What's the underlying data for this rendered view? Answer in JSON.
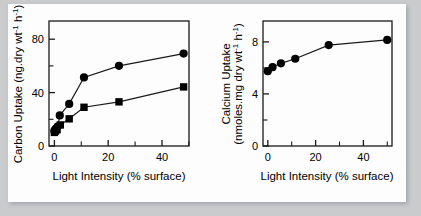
{
  "figure": {
    "background_color": "#c9cbcd",
    "panel_color": "#fdfdfd",
    "line_color": "#1a1a1a",
    "marker_color": "#000000"
  },
  "chart_data": [
    {
      "type": "line",
      "id": "carbon-uptake",
      "title": "",
      "xlabel": "Light Intensity (% surface)",
      "ylabel": "Carbon Uptake (ng.dry wt⁻¹ h⁻¹)",
      "ylabel_main": "Carbon Uptake",
      "ylabel_units": "(ng.dry wt⁻¹ h⁻¹)",
      "xlim": [
        -2,
        50
      ],
      "ylim": [
        0,
        92
      ],
      "xticks": [
        0,
        20,
        40
      ],
      "xticks_minor": [
        10,
        30,
        50
      ],
      "yticks": [
        0,
        40,
        80
      ],
      "yticks_minor": [
        20,
        60
      ],
      "grid": false,
      "legend": "none",
      "series": [
        {
          "name": "circles",
          "marker": "circle",
          "x": [
            0.0,
            0.3,
            0.7,
            1.3,
            2.0,
            5.5,
            11.0,
            24.0,
            48.0
          ],
          "values": [
            11.0,
            12.0,
            13.0,
            14.5,
            22.5,
            31.0,
            50.5,
            59.0,
            68.0
          ]
        },
        {
          "name": "squares",
          "marker": "square",
          "x": [
            0.0,
            0.4,
            1.0,
            2.2,
            5.5,
            11.0,
            24.0,
            48.0
          ],
          "values": [
            10.0,
            11.0,
            12.0,
            15.5,
            20.0,
            28.5,
            32.5,
            43.5
          ]
        }
      ]
    },
    {
      "type": "line",
      "id": "calcium-uptake",
      "title": "",
      "xlabel": "Light Intensity (% surface)",
      "ylabel": "Calcium Uptake (nmoles.mg dry wt⁻¹ h⁻¹)",
      "ylabel_main": "Calcium Uptake",
      "ylabel_units": "(nmoles.mg dry wt⁻¹ h⁻¹)",
      "xlim": [
        -2,
        52
      ],
      "ylim": [
        0,
        9.6
      ],
      "xticks": [
        0,
        20,
        40
      ],
      "xticks_minor": [
        10,
        30,
        50
      ],
      "yticks": [
        0,
        4,
        8
      ],
      "yticks_minor": [
        2,
        6
      ],
      "grid": false,
      "legend": "none",
      "series": [
        {
          "name": "circles",
          "marker": "circle",
          "x": [
            0.0,
            2.0,
            5.5,
            11.5,
            25.5,
            50.0
          ],
          "values": [
            5.75,
            6.05,
            6.35,
            6.7,
            7.75,
            8.15
          ]
        }
      ]
    }
  ],
  "labels": {
    "left_ytick_0": "0",
    "left_ytick_40": "40",
    "left_ytick_80": "80",
    "left_xtick_0": "0",
    "left_xtick_20": "20",
    "left_xtick_40": "40",
    "left_xaxis_title": "Light Intensity (% surface)",
    "left_yaxis_title": "Carbon Uptake (ng.dry wt",
    "left_yaxis_sup1": "-1",
    "left_yaxis_mid": " h",
    "left_yaxis_sup2": "-1",
    "left_yaxis_end": ")",
    "right_ytick_0": "0",
    "right_ytick_4": "4",
    "right_ytick_8": "8",
    "right_xtick_0": "0",
    "right_xtick_20": "20",
    "right_xtick_40": "40",
    "right_xaxis_title": "Light Intensity (% surface)",
    "right_yaxis_line1": "Calcium Uptake",
    "right_yaxis_line2_a": "(nmoles.mg dry wt",
    "right_yaxis_sup1": "-1",
    "right_yaxis_line2_b": " h",
    "right_yaxis_sup2": "-1",
    "right_yaxis_line2_c": ")"
  }
}
